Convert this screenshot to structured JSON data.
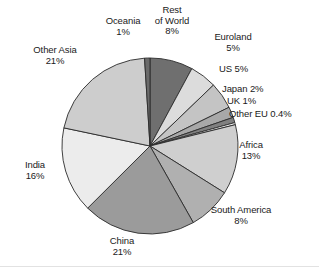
{
  "chart_data": {
    "type": "pie",
    "title": "",
    "xlabel": "",
    "ylabel": "",
    "legend_position": "none",
    "grid": false,
    "start_angle_deg": 0,
    "direction": "clockwise",
    "center": {
      "x": 150,
      "y": 146
    },
    "radius": 88,
    "categories": [
      "Rest of World",
      "Euroland",
      "US",
      "Japan",
      "UK",
      "Other EU",
      "Africa",
      "South America",
      "China",
      "India",
      "Other Asia",
      "Oceania"
    ],
    "values": [
      8,
      5,
      5,
      2,
      1,
      0.4,
      13,
      8,
      21,
      16,
      21,
      1
    ],
    "value_labels": [
      "8%",
      "5%",
      "5%",
      "2%",
      "1%",
      "0.4%",
      "13%",
      "8%",
      "21%",
      "16%",
      "21%",
      "1%"
    ],
    "colors": [
      "#6f6f6f",
      "#dcdcdc",
      "#c4c4c4",
      "#a8a8a8",
      "#808080",
      "#efefef",
      "#cfcfcf",
      "#b0b0b0",
      "#9b9b9b",
      "#ececec",
      "#cdcdcd",
      "#6a6a6a"
    ],
    "slice_border_color": "#2b2b2b",
    "slices": [
      {
        "name": "Rest of World",
        "value": 8,
        "label": "8%",
        "color": "#6f6f6f"
      },
      {
        "name": "Euroland",
        "value": 5,
        "label": "5%",
        "color": "#dcdcdc"
      },
      {
        "name": "US",
        "value": 5,
        "label": "5%",
        "color": "#c4c4c4"
      },
      {
        "name": "Japan",
        "value": 2,
        "label": "2%",
        "color": "#a8a8a8"
      },
      {
        "name": "UK",
        "value": 1,
        "label": "1%",
        "color": "#808080"
      },
      {
        "name": "Other EU",
        "value": 0.4,
        "label": "0.4%",
        "color": "#efefef"
      },
      {
        "name": "Africa",
        "value": 13,
        "label": "13%",
        "color": "#cfcfcf"
      },
      {
        "name": "South America",
        "value": 8,
        "label": "8%",
        "color": "#b0b0b0"
      },
      {
        "name": "China",
        "value": 21,
        "label": "21%",
        "color": "#9b9b9b"
      },
      {
        "name": "India",
        "value": 16,
        "label": "16%",
        "color": "#ececec"
      },
      {
        "name": "Other Asia",
        "value": 21,
        "label": "21%",
        "color": "#cdcdcd"
      },
      {
        "name": "Oceania",
        "value": 1,
        "label": "1%",
        "color": "#6a6a6a"
      }
    ]
  },
  "labels": {
    "rest_of_world": {
      "line1": "Rest",
      "line2": "of World",
      "line3": "8%"
    },
    "oceania": {
      "line1": "Oceania",
      "line2": "1%"
    },
    "other_asia": {
      "line1": "Other Asia",
      "line2": "21%"
    },
    "india": {
      "line1": "India",
      "line2": "16%"
    },
    "china": {
      "line1": "China",
      "line2": "21%"
    },
    "south_america": {
      "line1": "South America",
      "line2": "8%"
    },
    "africa": {
      "line1": "Africa",
      "line2": "13%"
    },
    "other_eu": {
      "line1": "Other EU 0.4%"
    },
    "uk": {
      "line1": "UK 1%"
    },
    "japan": {
      "line1": "Japan 2%"
    },
    "us": {
      "line1": "US 5%"
    },
    "euroland": {
      "line1": "Euroland",
      "line2": "5%"
    }
  }
}
